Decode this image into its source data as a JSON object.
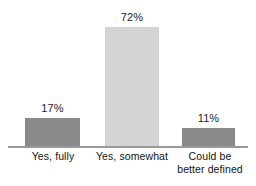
{
  "chart_data": {
    "type": "bar",
    "title": "",
    "subtitle": "",
    "xlabel": "",
    "ylabel": "",
    "ylim": [
      0,
      80
    ],
    "grid": false,
    "legend": false,
    "value_suffix": "%",
    "categories": [
      "Yes, fully",
      "Yes, somewhat",
      "Could be\nbetter defined"
    ],
    "values": [
      17,
      72,
      11
    ],
    "value_labels": [
      "17%",
      "72%",
      "11%"
    ],
    "colors": [
      "#8a8a8a",
      "#d4d4d4",
      "#8a8a8a"
    ],
    "axis_color": "#9a9a9a",
    "background": "#ffffff",
    "bars": [
      {
        "category_line1": "Yes, fully",
        "category_line2": "",
        "value": 17,
        "value_label": "17%",
        "color": "#8a8a8a"
      },
      {
        "category_line1": "Yes, somewhat",
        "category_line2": "",
        "value": 72,
        "value_label": "72%",
        "color": "#d4d4d4"
      },
      {
        "category_line1": "Could be",
        "category_line2": "better defined",
        "value": 11,
        "value_label": "11%",
        "color": "#8a8a8a"
      }
    ]
  },
  "layout": {
    "bar_geometry": [
      {
        "left": 25,
        "width": 55,
        "height": 29
      },
      {
        "left": 105,
        "width": 54,
        "height": 120
      },
      {
        "left": 182,
        "width": 53,
        "height": 19
      }
    ],
    "label_geometry": [
      {
        "left": 10,
        "width": 86
      },
      {
        "left": 90,
        "width": 84
      },
      {
        "left": 172,
        "width": 76
      }
    ]
  }
}
